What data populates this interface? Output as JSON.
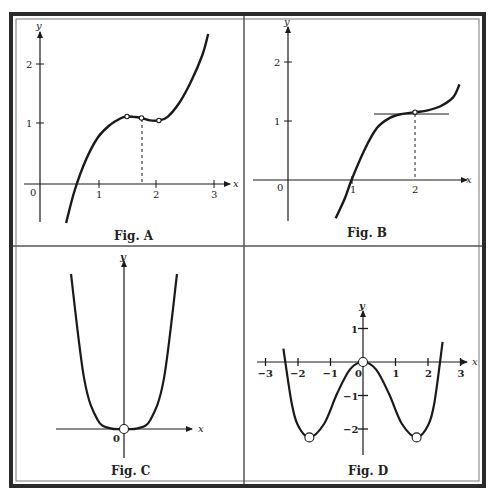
{
  "frame": {
    "outer": "#2a2a2a",
    "divider": "#555555",
    "background": "#ffffff",
    "ink": "#1a1a1a"
  },
  "panels": [
    {
      "id": "A",
      "caption": "Fig. A",
      "x_label": "x",
      "y_label": "y",
      "x_ticks": [
        "1",
        "2",
        "3"
      ],
      "y_ticks": [
        "1",
        "2"
      ],
      "origin_label": "0",
      "open_points": [
        [
          1.5,
          1.125
        ],
        [
          1.75,
          1.1
        ],
        [
          2.05,
          1.06
        ]
      ],
      "dashed_drop_x": 1.75
    },
    {
      "id": "B",
      "caption": "Fig. B",
      "x_label": "x",
      "y_label": "y",
      "x_ticks": [
        "1",
        "2"
      ],
      "y_ticks": [
        "1",
        "2"
      ],
      "origin_label": "0",
      "open_points": [
        [
          2,
          1.15
        ]
      ],
      "dashed_drop_x": 2,
      "tangent_line": {
        "from_x": 1.35,
        "to_x": 2.5,
        "y": 1.13
      }
    },
    {
      "id": "C",
      "caption": "Fig. C",
      "x_label": "x",
      "y_label": "y",
      "origin_label": "0",
      "open_points": [
        [
          0,
          0
        ]
      ]
    },
    {
      "id": "D",
      "caption": "Fig. D",
      "x_label": "x",
      "y_label": "y",
      "x_ticks": [
        "-3",
        "-2",
        "-1",
        "1",
        "2",
        "3"
      ],
      "y_ticks": [
        "1",
        "-1",
        "-2"
      ],
      "origin_label": "0",
      "open_points": [
        [
          -1.65,
          -2.25
        ],
        [
          0,
          0
        ],
        [
          1.65,
          -2.25
        ]
      ]
    }
  ],
  "chart_data": [
    {
      "type": "line",
      "title": "Fig. A",
      "xlabel": "x",
      "ylabel": "y",
      "xlim": [
        0,
        3
      ],
      "ylim": [
        -0.7,
        2.5
      ],
      "x": [
        0.45,
        0.6,
        0.8,
        1.0,
        1.2,
        1.4,
        1.5,
        1.6,
        1.75,
        1.9,
        2.05,
        2.2,
        2.4,
        2.6,
        2.8,
        2.9
      ],
      "y": [
        -0.65,
        -0.1,
        0.42,
        0.78,
        0.98,
        1.1,
        1.125,
        1.12,
        1.1,
        1.06,
        1.06,
        1.12,
        1.35,
        1.7,
        2.15,
        2.5
      ],
      "annotations": [
        "open points at x≈1.5, 1.75, 2.05",
        "dashed vertical line at x≈1.75"
      ]
    },
    {
      "type": "line",
      "title": "Fig. B",
      "xlabel": "x",
      "ylabel": "y",
      "xlim": [
        0,
        2.7
      ],
      "ylim": [
        -0.7,
        2.5
      ],
      "x": [
        0.75,
        0.9,
        1.0,
        1.2,
        1.4,
        1.6,
        1.8,
        2.0,
        2.2,
        2.4,
        2.6,
        2.7
      ],
      "y": [
        -0.65,
        -0.3,
        0.0,
        0.5,
        0.88,
        1.05,
        1.12,
        1.15,
        1.18,
        1.25,
        1.4,
        1.62
      ],
      "annotations": [
        "horizontal tangent line at y≈1.13 from x≈1.35 to 2.5",
        "open point at (2, 1.15)",
        "dashed vertical line at x=2"
      ]
    },
    {
      "type": "line",
      "title": "Fig. C",
      "xlabel": "x",
      "ylabel": "y",
      "x": [
        -1.0,
        -0.75,
        -0.5,
        -0.25,
        0,
        0.25,
        0.5,
        0.75,
        1.0
      ],
      "y": [
        1.0,
        0.32,
        0.06,
        0.004,
        0,
        0.004,
        0.06,
        0.32,
        1.0
      ],
      "annotations": [
        "open point at origin",
        "no numeric ticks"
      ]
    },
    {
      "type": "line",
      "title": "Fig. D",
      "xlabel": "x",
      "ylabel": "y",
      "xlim": [
        -3,
        3
      ],
      "ylim": [
        -2.6,
        1.5
      ],
      "x": [
        -2.45,
        -2.2,
        -2.0,
        -1.65,
        -1.2,
        -0.8,
        -0.4,
        0,
        0.4,
        0.8,
        1.2,
        1.65,
        2.0,
        2.2,
        2.45
      ],
      "y": [
        0.4,
        -1.2,
        -1.9,
        -2.25,
        -1.85,
        -0.95,
        -0.22,
        0,
        -0.22,
        -0.95,
        -1.85,
        -2.25,
        -1.9,
        -1.2,
        0.6
      ],
      "annotations": [
        "open points at (-1.65, -2.25), (0, 0), (1.65, -2.25)"
      ]
    }
  ]
}
